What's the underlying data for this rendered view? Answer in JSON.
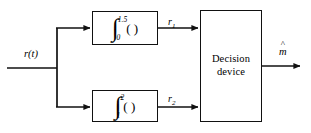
{
  "diagram": {
    "colors": {
      "stroke": "#111111",
      "background": "#ffffff",
      "text": "#000000"
    },
    "input": {
      "label": "r(t)"
    },
    "output": {
      "label": "m",
      "accent": "^"
    },
    "blocks": [
      {
        "id": "integrator-top",
        "kind": "integrator",
        "integral_sign": "∫",
        "lower_limit": "0",
        "upper_limit": "1.5",
        "operand": "( )",
        "output_label": "r",
        "output_subscript": "1"
      },
      {
        "id": "integrator-bottom",
        "kind": "integrator",
        "integral_sign": "∫",
        "lower_limit": "1",
        "upper_limit": "2",
        "operand": "( )",
        "output_label": "r",
        "output_subscript": "2"
      },
      {
        "id": "decision-block",
        "kind": "decision",
        "line1": "Decision",
        "line2": "device"
      }
    ]
  }
}
